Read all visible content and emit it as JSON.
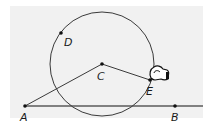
{
  "diagram": {
    "type": "geometry-construction",
    "colors": {
      "background": "#f1f1f1",
      "stroke": "#3a3a3a",
      "line": "#555555",
      "point": "#111111"
    },
    "circle": {
      "center": "C",
      "cx": 102,
      "cy": 64,
      "r": 52
    },
    "points": [
      {
        "id": "A",
        "label": "A",
        "x": 25,
        "y": 106
      },
      {
        "id": "B",
        "label": "B",
        "x": 175,
        "y": 106
      },
      {
        "id": "C",
        "label": "C",
        "x": 102,
        "y": 64
      },
      {
        "id": "D",
        "label": "D",
        "x": 61,
        "y": 33
      },
      {
        "id": "E",
        "label": "E",
        "x": 150,
        "y": 80
      }
    ],
    "segments": [
      {
        "from": "A",
        "to": "C"
      },
      {
        "from": "C",
        "to": "E"
      }
    ],
    "line": {
      "through": [
        "A",
        "B"
      ],
      "x1": 25,
      "y1": 106,
      "x2": 203,
      "y2": 106
    },
    "cursor": {
      "type": "hand-grab",
      "near": "E"
    }
  }
}
